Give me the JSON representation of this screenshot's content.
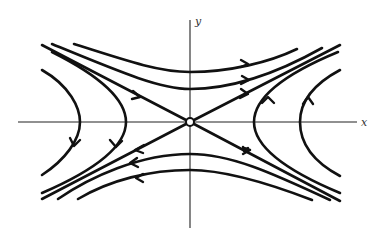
{
  "diagram": {
    "type": "phase-portrait",
    "axes": {
      "x_label": "x",
      "y_label": "y"
    },
    "origin": {
      "marker": "open-circle"
    },
    "separatrices": [
      {
        "direction": "incoming",
        "from": "upper-left",
        "to": "origin"
      },
      {
        "direction": "incoming",
        "from": "lower-right",
        "to": "origin"
      },
      {
        "direction": "outgoing",
        "from": "origin",
        "to": "upper-right"
      },
      {
        "direction": "outgoing",
        "from": "origin",
        "to": "lower-left"
      }
    ],
    "trajectory_groups": [
      {
        "region": "top",
        "count": 2,
        "flow": "left-to-right"
      },
      {
        "region": "bottom",
        "count": 2,
        "flow": "right-to-left"
      },
      {
        "region": "left",
        "count": 2,
        "flow": "top-to-bottom"
      },
      {
        "region": "right",
        "count": 2,
        "flow": "bottom-to-top"
      }
    ],
    "colors": {
      "stroke": "#111111",
      "background": "#ffffff"
    }
  }
}
